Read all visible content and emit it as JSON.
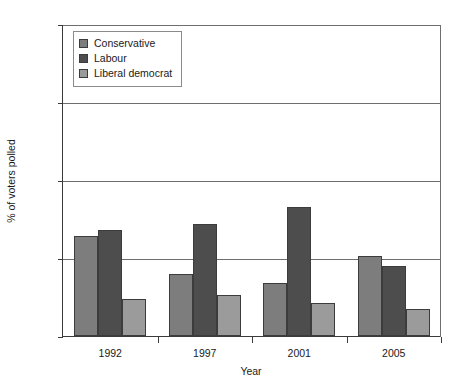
{
  "chart_data": {
    "type": "bar",
    "title": "",
    "xlabel": "Year",
    "ylabel": "% of voters polled",
    "categories": [
      "1992",
      "1997",
      "2001",
      "2005"
    ],
    "series": [
      {
        "name": "Conservative",
        "color": "#7d7d7d",
        "values": [
          32,
          20,
          17,
          25.5
        ]
      },
      {
        "name": "Labour",
        "color": "#4d4d4d",
        "values": [
          34,
          36,
          41.5,
          22.5
        ]
      },
      {
        "name": "Liberal democrat",
        "color": "#9b9b9b",
        "values": [
          12,
          13,
          10.5,
          8.5
        ]
      }
    ],
    "ylim": [
      0,
      100
    ],
    "yticks": [
      0,
      25,
      50,
      75,
      100
    ],
    "ytick_labels": [
      "0",
      "25",
      "50",
      "75",
      "100"
    ],
    "grid": true,
    "legend_position": "top-left"
  },
  "axis": {
    "y_title": "% of voters polled",
    "x_title": "Year"
  },
  "legend": {
    "items": [
      {
        "label": "Conservative"
      },
      {
        "label": "Labour"
      },
      {
        "label": "Liberal democrat"
      }
    ]
  }
}
